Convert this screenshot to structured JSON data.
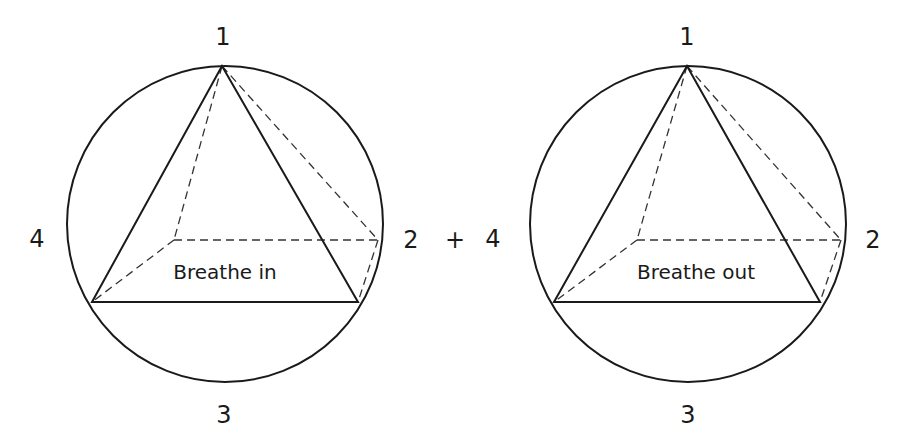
{
  "operator": {
    "text": "+",
    "x": 455,
    "y": 240
  },
  "figures": [
    {
      "name": "breathe-in",
      "caption": "Breathe in",
      "caption_pos": [
        225,
        279
      ],
      "circle": {
        "cx": 225,
        "cy": 224,
        "r": 158
      },
      "points": {
        "apex": [
          222,
          66
        ],
        "base_left": [
          92,
          302
        ],
        "base_right": [
          358,
          302
        ],
        "hidden": [
          174,
          240
        ],
        "right": [
          378,
          240
        ]
      },
      "labels": [
        {
          "text": "1",
          "x": 223,
          "y": 37
        },
        {
          "text": "2",
          "x": 411,
          "y": 240
        },
        {
          "text": "3",
          "x": 224,
          "y": 415
        },
        {
          "text": "4",
          "x": 37,
          "y": 239
        }
      ]
    },
    {
      "name": "breathe-out",
      "caption": "Breathe out",
      "caption_pos": [
        696,
        279
      ],
      "circle": {
        "cx": 688,
        "cy": 224,
        "r": 158
      },
      "points": {
        "apex": [
          687,
          66
        ],
        "base_left": [
          554,
          302
        ],
        "base_right": [
          820,
          302
        ],
        "hidden": [
          637,
          240
        ],
        "right": [
          841,
          240
        ]
      },
      "labels": [
        {
          "text": "1",
          "x": 687,
          "y": 37
        },
        {
          "text": "2",
          "x": 873,
          "y": 240
        },
        {
          "text": "3",
          "x": 688,
          "y": 415
        },
        {
          "text": "4",
          "x": 493,
          "y": 239
        }
      ]
    }
  ]
}
